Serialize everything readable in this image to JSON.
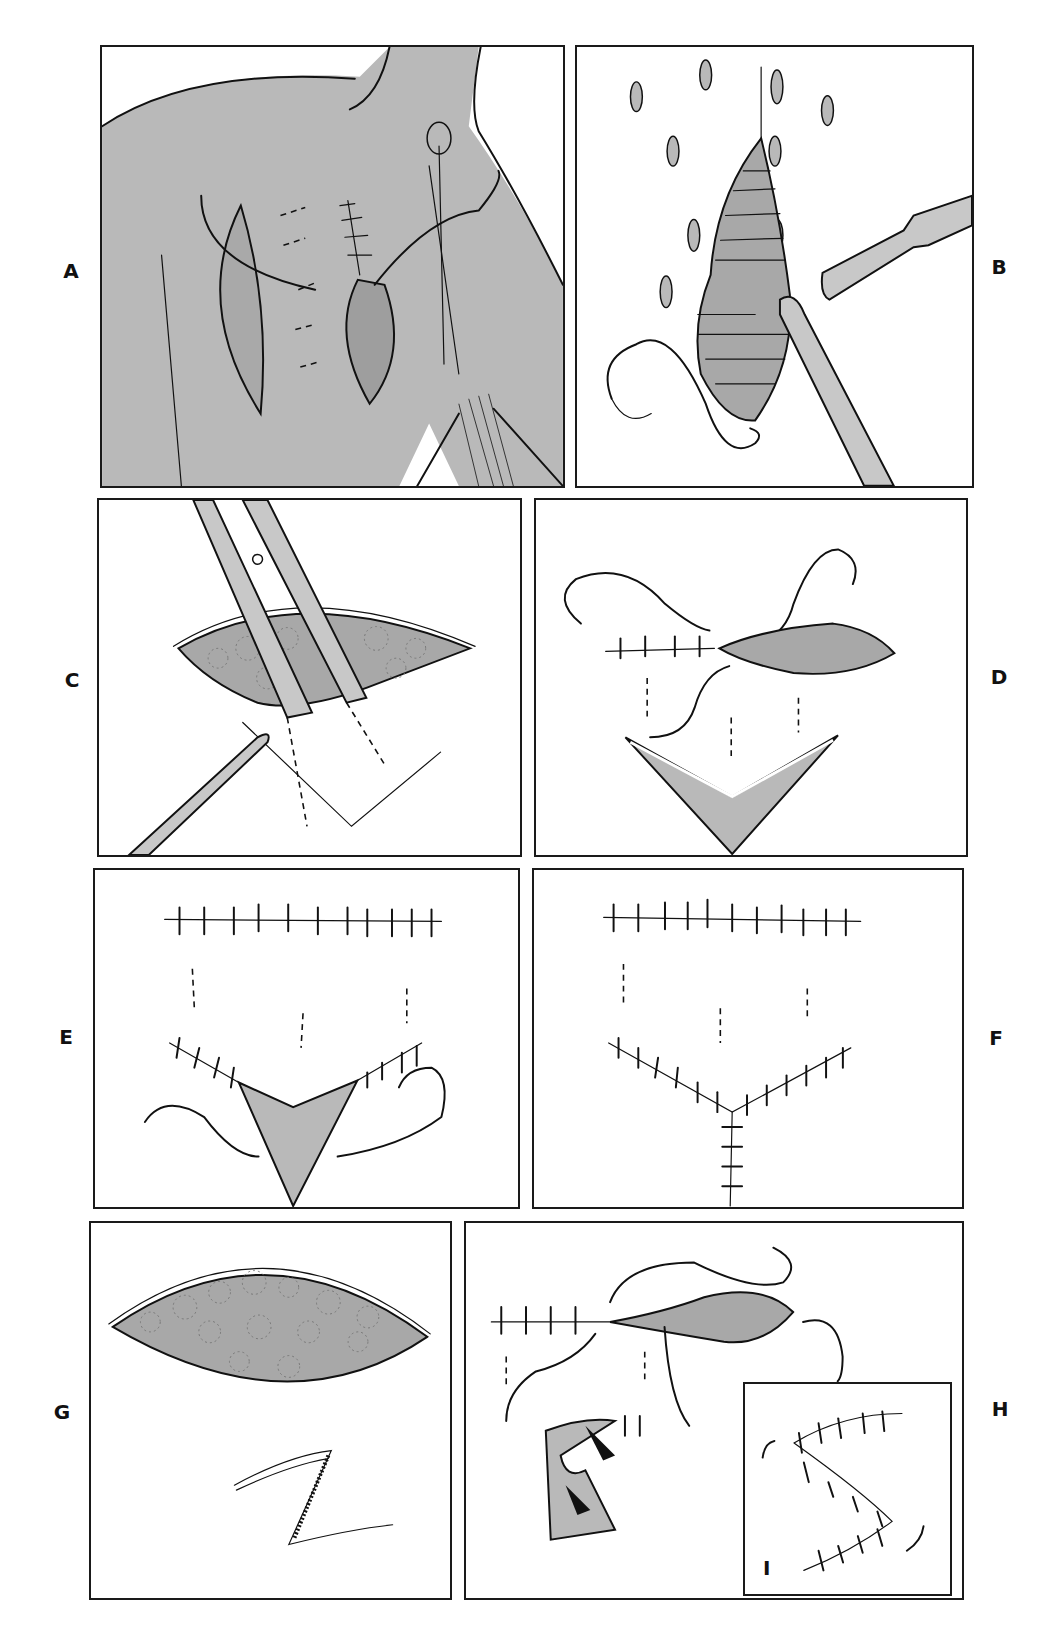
{
  "figure": {
    "title": "",
    "panels": [
      {
        "id": "A",
        "label": "A",
        "description": "Shoulder/chest skin with elliptical incision and sutured wound with tissue exposed"
      },
      {
        "id": "B",
        "label": "B",
        "description": "Teardrop wound with retractor, forceps and curved needle with suture; surrounding oval marks"
      },
      {
        "id": "C",
        "label": "C",
        "description": "Scissors undermining skin flap of lens-shaped wound held with forceps; V-shaped incision outline"
      },
      {
        "id": "D",
        "label": "D",
        "description": "Partially closed linear wound with interrupted sutures, needles, and V-shaped defect"
      },
      {
        "id": "E",
        "label": "E",
        "description": "Closed linear suture line above; V-flap being advanced with sutures and needle"
      },
      {
        "id": "F",
        "label": "F",
        "description": "Final V-Y closure with interrupted sutures"
      },
      {
        "id": "G",
        "label": "G",
        "description": "Lens-shaped open wound with tissue texture and Z-plasty incision"
      },
      {
        "id": "H",
        "label": "H",
        "description": "Partially closed wound with needles, Z-plasty flaps transposed with arrows"
      },
      {
        "id": "I",
        "label": "I",
        "description": "Inset: completed S-shaped sutured closure"
      }
    ]
  },
  "colors": {
    "frame": "#1a1a1a",
    "tissue_shade": "#b9b9b9",
    "background": "#ffffff",
    "ink": "#111111"
  }
}
